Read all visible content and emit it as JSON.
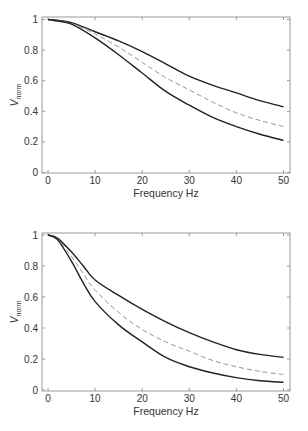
{
  "chart_data": [
    {
      "type": "line",
      "title": "",
      "xlabel": "Frequency Hz",
      "ylabel": "V_norm",
      "ylabel_main": "V",
      "ylabel_sub": "norm",
      "xlim": [
        0,
        50
      ],
      "ylim": [
        0,
        1
      ],
      "xticks": [
        "0",
        "10",
        "20",
        "30",
        "40",
        "50"
      ],
      "yticks": [
        "0",
        "0.2",
        "0.4",
        "0.6",
        "0.8",
        "1"
      ],
      "grid": false,
      "legend": null,
      "x": [
        0,
        2,
        5,
        10,
        15,
        20,
        25,
        30,
        35,
        40,
        45,
        50
      ],
      "series": [
        {
          "name": "upper (solid)",
          "style": "solid",
          "values": [
            1.0,
            0.995,
            0.98,
            0.92,
            0.86,
            0.79,
            0.71,
            0.63,
            0.57,
            0.52,
            0.47,
            0.43
          ]
        },
        {
          "name": "middle (dashed)",
          "style": "dashed",
          "values": [
            1.0,
            0.993,
            0.975,
            0.905,
            0.82,
            0.72,
            0.62,
            0.54,
            0.46,
            0.39,
            0.34,
            0.3
          ]
        },
        {
          "name": "lower (solid)",
          "style": "solid",
          "values": [
            1.0,
            0.99,
            0.97,
            0.88,
            0.77,
            0.65,
            0.53,
            0.44,
            0.36,
            0.3,
            0.25,
            0.21
          ]
        }
      ]
    },
    {
      "type": "line",
      "title": "",
      "xlabel": "Frequency Hz",
      "ylabel": "V_norm",
      "ylabel_main": "V",
      "ylabel_sub": "norm",
      "xlim": [
        0,
        50
      ],
      "ylim": [
        0,
        1
      ],
      "xticks": [
        "0",
        "10",
        "20",
        "30",
        "40",
        "50"
      ],
      "yticks": [
        "0",
        "0.2",
        "0.4",
        "0.6",
        "0.8",
        "1"
      ],
      "grid": false,
      "legend": null,
      "x": [
        0,
        2,
        5,
        7.5,
        10,
        15,
        20,
        25,
        30,
        35,
        40,
        45,
        50
      ],
      "series": [
        {
          "name": "upper (solid)",
          "style": "solid",
          "values": [
            1.0,
            0.98,
            0.89,
            0.8,
            0.71,
            0.61,
            0.52,
            0.44,
            0.37,
            0.31,
            0.26,
            0.23,
            0.21
          ]
        },
        {
          "name": "middle (dashed)",
          "style": "dashed",
          "values": [
            1.0,
            0.975,
            0.86,
            0.75,
            0.645,
            0.5,
            0.39,
            0.31,
            0.25,
            0.19,
            0.15,
            0.12,
            0.1
          ]
        },
        {
          "name": "lower (solid)",
          "style": "solid",
          "values": [
            1.0,
            0.97,
            0.83,
            0.69,
            0.57,
            0.42,
            0.31,
            0.21,
            0.15,
            0.11,
            0.08,
            0.06,
            0.05
          ]
        }
      ]
    }
  ]
}
